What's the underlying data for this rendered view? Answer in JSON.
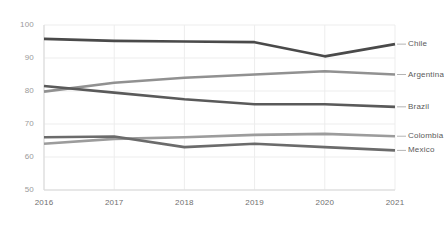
{
  "chart_data": {
    "type": "line",
    "title": "",
    "subtitle": "",
    "xlabel": "",
    "ylabel": "",
    "categories": [
      "2016",
      "2017",
      "2018",
      "2019",
      "2020",
      "2021"
    ],
    "x": [
      2016,
      2017,
      2018,
      2019,
      2020,
      2021
    ],
    "xlim": [
      2016,
      2021
    ],
    "ylim": [
      50,
      100
    ],
    "yticks": [
      50,
      60,
      70,
      80,
      90,
      100
    ],
    "xticks": [
      "2016",
      "2017",
      "2018",
      "2019",
      "2020",
      "2021"
    ],
    "grid": true,
    "grid_axis": "both",
    "legend": "right-inline-labels",
    "series": [
      {
        "name": "Chile",
        "color": "#4a4a4a",
        "values": [
          95.8,
          95.2,
          95.0,
          94.8,
          90.5,
          94.2
        ]
      },
      {
        "name": "Argentina",
        "color": "#919191",
        "values": [
          79.8,
          82.5,
          84.0,
          85.0,
          86.0,
          85.0
        ]
      },
      {
        "name": "Brazil",
        "color": "#5a5a5a",
        "values": [
          81.5,
          79.5,
          77.5,
          76.0,
          76.0,
          75.2
        ]
      },
      {
        "name": "Colombia",
        "color": "#9c9c9c",
        "values": [
          64.0,
          65.5,
          66.0,
          66.7,
          67.0,
          66.3
        ]
      },
      {
        "name": "Mexico",
        "color": "#6b6b6b",
        "values": [
          66.0,
          66.2,
          63.0,
          64.0,
          63.0,
          62.0
        ]
      }
    ],
    "y_tick_labels": [
      "100",
      "90",
      "80",
      "70",
      "60",
      "50"
    ]
  },
  "axis": {
    "y_labels": [
      "100",
      "90",
      "80",
      "70",
      "60",
      "50"
    ],
    "x_labels": [
      "2016",
      "2017",
      "2018",
      "2019",
      "2020",
      "2021"
    ]
  },
  "series_labels": {
    "chile": "Chile",
    "argentina": "Argentina",
    "brazil": "Brazil",
    "colombia": "Colombia",
    "mexico": "Mexico"
  },
  "colors": {
    "chile": "#4a4a4a",
    "argentina": "#919191",
    "brazil": "#5a5a5a",
    "colombia": "#9c9c9c",
    "mexico": "#6b6b6b",
    "grid": "#ededed",
    "axis": "#d8d8d8",
    "tick_text": "#9a9a9a",
    "label_text": "#5a5a5a",
    "background": "#ffffff"
  }
}
